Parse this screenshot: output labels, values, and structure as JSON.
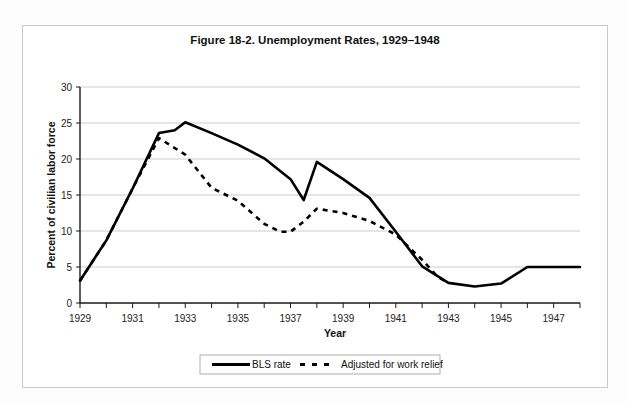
{
  "figure": {
    "title": "Figure 18-2. Unemployment Rates, 1929–1948",
    "xlabel": "Year",
    "ylabel": "Percent of civilian labor force"
  },
  "legend": {
    "items": [
      {
        "label": "BLS rate",
        "style": "solid",
        "color": "#000000"
      },
      {
        "label": "Adjusted for work relief",
        "style": "dashed",
        "color": "#000000"
      }
    ]
  },
  "axis": {
    "y_ticks": [
      "0",
      "5",
      "10",
      "15",
      "20",
      "25",
      "30"
    ],
    "x_ticks": [
      "1929",
      "1931",
      "1933",
      "1935",
      "1937",
      "1939",
      "1941",
      "1943",
      "1945",
      "1947"
    ]
  },
  "chart_data": {
    "type": "line",
    "title": "Figure 18-2. Unemployment Rates, 1929–1948",
    "xlabel": "Year",
    "ylabel": "Percent of civilian labor force",
    "xlim": [
      1929,
      1948
    ],
    "ylim": [
      0,
      30
    ],
    "grid": true,
    "legend_position": "bottom",
    "x": [
      1929,
      1930,
      1931,
      1932,
      1933,
      1934,
      1935,
      1936,
      1937,
      1938,
      1939,
      1940,
      1941,
      1942,
      1943,
      1944,
      1945,
      1946,
      1947,
      1948
    ],
    "series": [
      {
        "name": "BLS rate",
        "style": "solid",
        "values": [
          3.2,
          8.7,
          15.9,
          23.6,
          24.9,
          21.7,
          20.1,
          16.9,
          14.3,
          19.0,
          17.2,
          14.6,
          9.9,
          4.7,
          1.9,
          1.2,
          1.9,
          3.9,
          3.9,
          3.8
        ]
      },
      {
        "name": "Adjusted for work relief",
        "style": "dashed",
        "values": [
          3.2,
          8.7,
          15.9,
          22.9,
          20.6,
          16.0,
          14.2,
          9.9,
          9.1,
          12.5,
          11.3,
          9.5,
          6.0,
          3.1,
          1.8,
          1.2,
          1.9,
          3.9,
          3.9,
          3.8
        ]
      }
    ]
  },
  "render_note": {
    "solid_display_points": [
      [
        1929,
        3.1
      ],
      [
        1930,
        8.7
      ],
      [
        1931,
        15.9
      ],
      [
        1932,
        23.6
      ],
      [
        1932.6,
        24.0
      ],
      [
        1933,
        25.1
      ],
      [
        1934,
        23.6
      ],
      [
        1935,
        22.0
      ],
      [
        1936,
        20.1
      ],
      [
        1937,
        17.2
      ],
      [
        1937.5,
        14.3
      ],
      [
        1938,
        19.6
      ],
      [
        1939,
        17.2
      ],
      [
        1940,
        14.6
      ],
      [
        1941,
        9.9
      ],
      [
        1942,
        5.1
      ],
      [
        1943,
        2.8
      ],
      [
        1944,
        2.3
      ],
      [
        1945,
        2.7
      ],
      [
        1946,
        5.0
      ],
      [
        1947,
        5.0
      ],
      [
        1948,
        5.0
      ]
    ],
    "dashed_display_points": [
      [
        1929,
        3.1
      ],
      [
        1930,
        8.7
      ],
      [
        1931,
        15.9
      ],
      [
        1932,
        22.9
      ],
      [
        1933,
        20.6
      ],
      [
        1934,
        16.0
      ],
      [
        1935,
        14.2
      ],
      [
        1936,
        11.0
      ],
      [
        1936.6,
        9.9
      ],
      [
        1937,
        9.9
      ],
      [
        1937.5,
        11.3
      ],
      [
        1938,
        13.1
      ],
      [
        1939,
        12.5
      ],
      [
        1940,
        11.4
      ],
      [
        1941,
        9.5
      ],
      [
        1942,
        6.0
      ],
      [
        1942.6,
        3.6
      ],
      [
        1943,
        2.8
      ]
    ]
  }
}
